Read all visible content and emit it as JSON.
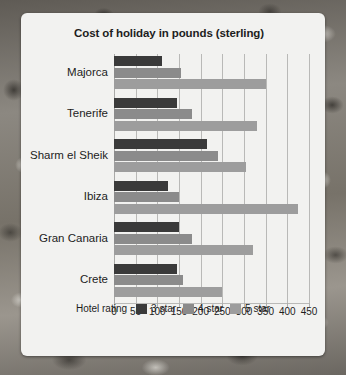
{
  "chart_data": {
    "type": "bar",
    "orientation": "horizontal",
    "title": "Cost of holiday in pounds (sterling)",
    "xlabel": "",
    "ylabel": "",
    "xlim": [
      0,
      450
    ],
    "xticks": [
      0,
      50,
      100,
      150,
      200,
      250,
      300,
      350,
      400,
      450
    ],
    "xtick_labels": [
      "0",
      "50",
      "100",
      "150",
      "200",
      "250",
      "300",
      "350",
      "400",
      "450"
    ],
    "grid": true,
    "legend_position": "bottom",
    "legend_title": "Hotel rating",
    "categories": [
      "Majorca",
      "Tenerife",
      "Sharm el Sheik",
      "Ibiza",
      "Gran Canaria",
      "Crete"
    ],
    "series": [
      {
        "name": "3 star",
        "color": "#3a3a3a",
        "values": [
          110,
          145,
          215,
          125,
          150,
          145
        ]
      },
      {
        "name": "4 star",
        "color": "#8b8b8b",
        "values": [
          155,
          180,
          240,
          150,
          180,
          160
        ]
      },
      {
        "name": "5 star",
        "color": "#9d9d9d",
        "values": [
          350,
          330,
          305,
          425,
          320,
          250
        ]
      }
    ]
  },
  "colors": {
    "card_background": "#f2f2f0",
    "grid": "#b9b9b7",
    "text": "#1d1d1d",
    "series_3_star": "#3a3a3a",
    "series_4_star": "#8b8b8b",
    "series_5_star": "#9d9d9d"
  }
}
